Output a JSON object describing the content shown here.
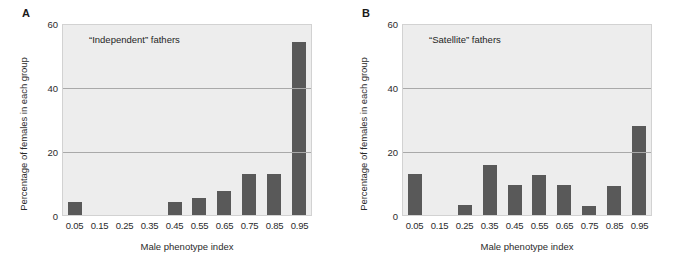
{
  "figure": {
    "panels": [
      {
        "letter": "A",
        "annotation": "“Independent” fathers",
        "ylabel": "Percentage of females in each group",
        "xlabel": "Male phenotype index"
      },
      {
        "letter": "B",
        "annotation": "“Satellite” fathers",
        "ylabel": "Percentage of females in each group",
        "xlabel": "Male phenotype index"
      }
    ]
  },
  "colors": {
    "bar": "#595959",
    "plot_background": "#ededed",
    "gridline": "#a9a9a9",
    "frame": "#d2d2d2",
    "text": "#2b2b2b"
  },
  "chart_data": [
    {
      "type": "bar",
      "title": "“Independent” fathers",
      "panel": "A",
      "xlabel": "Male phenotype index",
      "ylabel": "Percentage of females in each group",
      "categories": [
        "0.05",
        "0.15",
        "0.25",
        "0.35",
        "0.45",
        "0.55",
        "0.65",
        "0.75",
        "0.85",
        "0.95"
      ],
      "values": [
        4,
        0,
        0,
        0,
        4,
        5.5,
        7.5,
        13,
        13,
        54.5
      ],
      "ylim": [
        0,
        60
      ],
      "yticks": [
        0,
        20,
        40,
        60
      ],
      "grid": true,
      "legend": "none"
    },
    {
      "type": "bar",
      "title": "“Satellite” fathers",
      "panel": "B",
      "xlabel": "Male phenotype index",
      "ylabel": "Percentage of females in each group",
      "categories": [
        "0.05",
        "0.15",
        "0.25",
        "0.35",
        "0.45",
        "0.55",
        "0.65",
        "0.75",
        "0.85",
        "0.95"
      ],
      "values": [
        12.8,
        0,
        3.3,
        15.8,
        9.6,
        12.5,
        9.6,
        2.8,
        9.3,
        28
      ],
      "ylim": [
        0,
        60
      ],
      "yticks": [
        0,
        20,
        40,
        60
      ],
      "grid": true,
      "legend": "none"
    }
  ]
}
